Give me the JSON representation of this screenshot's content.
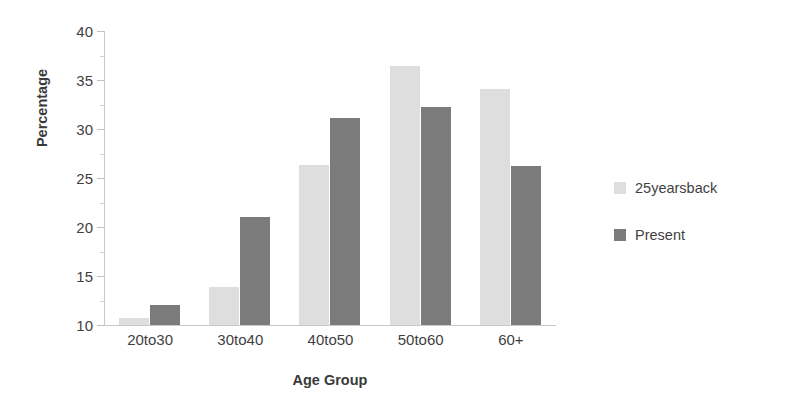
{
  "chart_data": {
    "type": "bar",
    "title": "",
    "xlabel": "Age Group",
    "ylabel": "Percentage",
    "categories": [
      "20to30",
      "30to40",
      "40to50",
      "50to60",
      "60+"
    ],
    "series": [
      {
        "name": "25yearsback",
        "color": "#dedede",
        "values": [
          10.7,
          13.9,
          26.3,
          36.4,
          34.1
        ]
      },
      {
        "name": "Present",
        "color": "#7b7b7b",
        "values": [
          12.0,
          21.0,
          31.1,
          32.2,
          26.2
        ]
      }
    ],
    "ylim": [
      10,
      40
    ],
    "ytick_labels": [
      "10",
      "15",
      "20",
      "25",
      "30",
      "35",
      "40"
    ],
    "ytick_values": [
      10,
      15,
      20,
      25,
      30,
      35,
      40
    ],
    "yminor_values": [
      12.5,
      17.5,
      22.5,
      27.5,
      32.5,
      37.5
    ],
    "grid": false,
    "legend_position": "right"
  },
  "legend": {
    "entries": [
      {
        "label": "25yearsback",
        "color": "#dedede"
      },
      {
        "label": "Present",
        "color": "#7b7b7b"
      }
    ]
  }
}
